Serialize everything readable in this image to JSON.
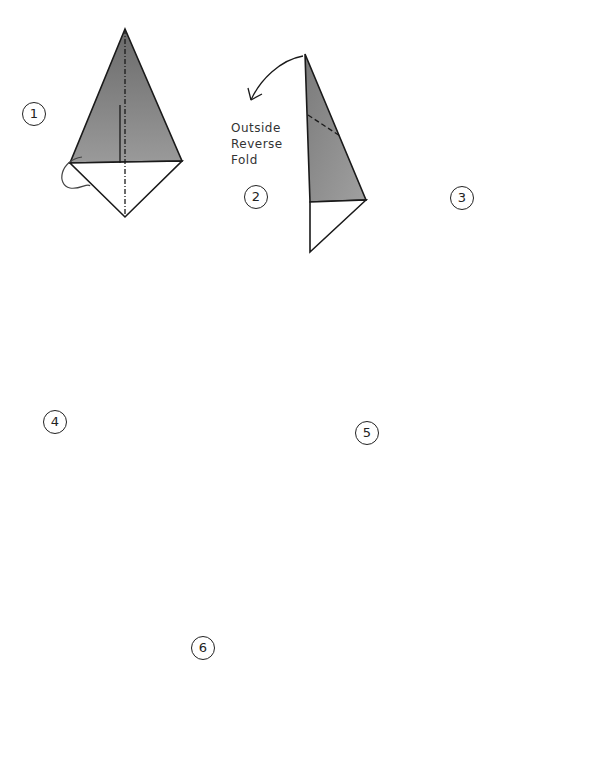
{
  "diagram": {
    "colors": {
      "paper_gray": "#8a8a8a",
      "paper_light": "#a8a8a8",
      "paper_dark": "#5a5a5a",
      "line": "#1a1a1a",
      "white": "#ffffff"
    },
    "steps": [
      {
        "number": "1",
        "annotation": ""
      },
      {
        "number": "2",
        "annotation": [
          "Outside",
          "Reverse",
          "Fold"
        ]
      },
      {
        "number": "3",
        "annotation": ""
      },
      {
        "number": "4",
        "annotation": ""
      },
      {
        "number": "5",
        "annotation": ""
      },
      {
        "number": "6",
        "annotation": ""
      }
    ]
  }
}
